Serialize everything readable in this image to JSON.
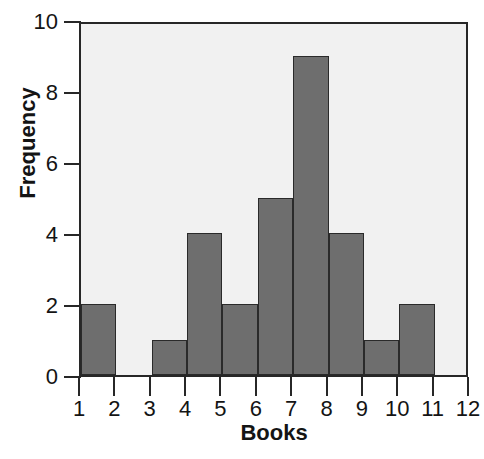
{
  "chart_data": {
    "type": "bar",
    "title": "",
    "subtitle": "",
    "xlabel": "Books",
    "ylabel": "Frequency",
    "categories": [
      "1-2",
      "2-3",
      "3-4",
      "4-5",
      "5-6",
      "6-7",
      "7-8",
      "8-9",
      "9-10",
      "10-11",
      "11-12"
    ],
    "bin_edges": [
      1,
      2,
      3,
      4,
      5,
      6,
      7,
      8,
      9,
      10,
      11,
      12
    ],
    "values": [
      2,
      0,
      1,
      4,
      2,
      5,
      9,
      4,
      1,
      2,
      0
    ],
    "xtick_labels": [
      "1",
      "2",
      "3",
      "4",
      "5",
      "6",
      "7",
      "8",
      "9",
      "10",
      "11",
      "12"
    ],
    "ytick_labels": [
      "0",
      "2",
      "4",
      "6",
      "8",
      "10"
    ],
    "ytick_values": [
      0,
      2,
      4,
      6,
      8,
      10
    ],
    "xlim": [
      1,
      12
    ],
    "ylim": [
      0,
      10
    ],
    "grid": false,
    "legend": false,
    "bar_color": "#6e6e6e",
    "bar_edge_color": "#2a2a2a",
    "plot_background": "#f1f1f1",
    "axis_color": "#272727",
    "text_color": "#141414",
    "total_count": 30
  }
}
